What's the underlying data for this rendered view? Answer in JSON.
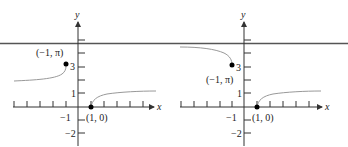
{
  "figure": {
    "panels": [
      {
        "id": "left",
        "y_axis_label": "y",
        "x_axis_label": "x",
        "y_tick_labels": [
          "3",
          "1",
          "−1",
          "−2"
        ],
        "x_tick_labels": [
          "−1"
        ],
        "point_a_label": "(−1, π)",
        "point_b_label": "(1, 0)"
      },
      {
        "id": "right",
        "y_axis_label": "y",
        "x_axis_label": "x",
        "y_tick_labels": [
          "3",
          "1",
          "−1",
          "−2"
        ],
        "x_tick_labels": [
          "−1"
        ],
        "point_a_label": "(−1, π)",
        "point_b_label": "(1, 0)"
      }
    ],
    "colors": {
      "axis": "#333333",
      "curve": "#999999",
      "asymptote": "#555555",
      "point": "#000000"
    }
  }
}
